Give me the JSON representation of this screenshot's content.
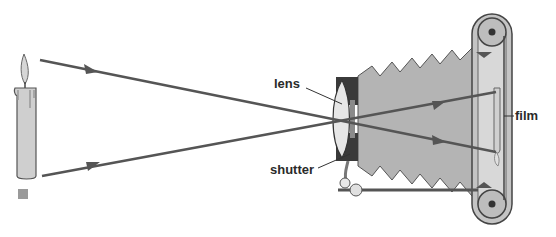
{
  "diagram": {
    "labels": {
      "lens": "lens",
      "shutter": "shutter",
      "film": "film"
    },
    "colors": {
      "ray": "#555555",
      "bellows": "#b4b4b4",
      "body": "#3a3a3a",
      "candle": "#c8c8c8",
      "marker": "#9a9a9a"
    }
  }
}
